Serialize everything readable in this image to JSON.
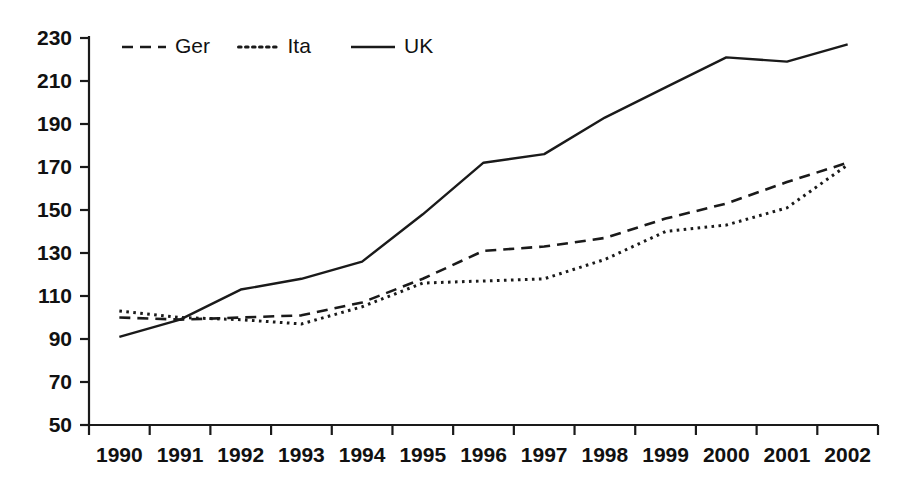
{
  "chart_data": {
    "type": "line",
    "title": "",
    "subtitle": "",
    "xlabel": "",
    "ylabel": "",
    "categories": [
      "1990",
      "1991",
      "1992",
      "1993",
      "1994",
      "1995",
      "1996",
      "1997",
      "1998",
      "1999",
      "2000",
      "2001",
      "2002"
    ],
    "x": [
      1990,
      1991,
      1992,
      1993,
      1994,
      1995,
      1996,
      1997,
      1998,
      1999,
      2000,
      2001,
      2002
    ],
    "series": [
      {
        "name": "Ger",
        "style": "dashed",
        "color": "#1a1a1a",
        "values": [
          100,
          99,
          100,
          101,
          107,
          118,
          131,
          133,
          137,
          146,
          153,
          163,
          172
        ]
      },
      {
        "name": "Ita",
        "style": "dotted",
        "color": "#1a1a1a",
        "values": [
          103,
          100,
          99,
          97,
          105,
          116,
          117,
          118,
          127,
          140,
          143,
          151,
          171
        ]
      },
      {
        "name": "UK",
        "style": "solid",
        "color": "#1a1a1a",
        "values": [
          91,
          99,
          113,
          118,
          126,
          148,
          172,
          176,
          193,
          207,
          221,
          219,
          227
        ]
      }
    ],
    "ylim": [
      50,
      230
    ],
    "ytick_step": 20,
    "yticks": [
      230,
      210,
      190,
      170,
      150,
      130,
      110,
      90,
      70,
      50
    ],
    "ytick_labels": [
      "230",
      "210",
      "190",
      "170",
      "150",
      "130",
      "110",
      "90",
      "70",
      "50"
    ],
    "grid": false,
    "legend_position": "top-left-inside",
    "legend_entries": [
      {
        "label": "Ger",
        "style": "dashed"
      },
      {
        "label": "Ita",
        "style": "dotted"
      },
      {
        "label": "UK",
        "style": "solid"
      }
    ],
    "annotations": []
  }
}
